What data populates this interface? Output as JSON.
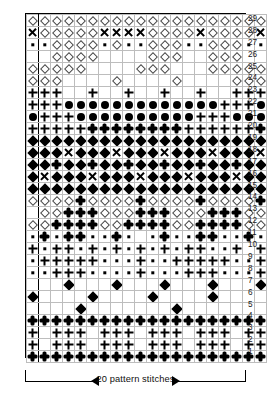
{
  "chart_data": {
    "type": "table",
    "title": "20 pattern stitches",
    "xlabel": "pattern stitches",
    "ylabel": "row",
    "columns": 20,
    "rows": 29,
    "grid": true,
    "legend_position": "none",
    "repeat_marker_after_column": 1,
    "row_labels": [
      "29",
      "28",
      "27",
      "26",
      "25",
      "24",
      "23",
      "22",
      "21",
      "20",
      "19",
      "18",
      "17",
      "16",
      "15",
      "14",
      "13",
      "12",
      "11",
      "10",
      "9",
      "8",
      "7",
      "6",
      "5",
      "4",
      "3",
      "2",
      "1"
    ],
    "symbol_key": {
      "d": "diamond-open",
      "D": "diamond-filled",
      "o": "circle-filled",
      "s": "square-small",
      "+": "plus",
      "x": "xmark",
      "c": "club",
      ".": "empty"
    },
    "cells": [
      {
        "row": "29",
        "symbols": [
          "d",
          "d",
          "d",
          "d",
          "d",
          "d",
          "d",
          "d",
          "d",
          "d",
          "d",
          "d",
          "d",
          "d",
          "d",
          "d",
          "d",
          "d",
          "d",
          "d"
        ]
      },
      {
        "row": "28",
        "symbols": [
          "x",
          "d",
          "d",
          "d",
          "d",
          "d",
          "x",
          "x",
          "x",
          "x",
          "d",
          "d",
          "d",
          "d",
          "x",
          "d",
          "d",
          "d",
          "d",
          "x"
        ]
      },
      {
        "row": "27",
        "symbols": [
          "s",
          "s",
          "d",
          "d",
          "d",
          "d",
          "s",
          "d",
          "s",
          "s",
          "d",
          "d",
          "d",
          "s",
          "s",
          "d",
          "d",
          "d",
          "s",
          "s"
        ]
      },
      {
        "row": "26",
        "symbols": [
          ".",
          ".",
          "d",
          "d",
          "d",
          "d",
          ".",
          ".",
          ".",
          ".",
          "d",
          "d",
          "d",
          ".",
          ".",
          "d",
          "d",
          "d",
          ".",
          "."
        ]
      },
      {
        "row": "25",
        "symbols": [
          "d",
          "d",
          "d",
          "d",
          "d",
          ".",
          ".",
          ".",
          ".",
          "d",
          "d",
          "d",
          ".",
          ".",
          ".",
          "d",
          "d",
          "d",
          "d",
          "d"
        ]
      },
      {
        "row": "24",
        "symbols": [
          "d",
          "d",
          "d",
          ".",
          ".",
          ".",
          ".",
          "d",
          ".",
          ".",
          ".",
          ".",
          "d",
          ".",
          ".",
          ".",
          ".",
          "d",
          "d",
          "d"
        ]
      },
      {
        "row": "23",
        "symbols": [
          "+",
          "+",
          "+",
          ".",
          ".",
          "+",
          ".",
          ".",
          "+",
          ".",
          ".",
          "+",
          ".",
          ".",
          "+",
          ".",
          ".",
          "+",
          "+",
          "+"
        ]
      },
      {
        "row": "22",
        "symbols": [
          "+",
          "+",
          "+",
          "o",
          "o",
          "o",
          "o",
          "o",
          "o",
          "o",
          "o",
          "o",
          "o",
          "o",
          "o",
          "o",
          "+",
          "+",
          "+",
          "o"
        ]
      },
      {
        "row": "21",
        "symbols": [
          "o",
          "+",
          "+",
          "+",
          "o",
          "o",
          "o",
          "o",
          "o",
          "o",
          "o",
          "o",
          "o",
          "o",
          "+",
          "+",
          "+",
          "o",
          "o",
          "o"
        ]
      },
      {
        "row": "20",
        "symbols": [
          "+",
          "+",
          "+",
          "+",
          "+",
          "c",
          "c",
          "c",
          "c",
          "c",
          "c",
          "c",
          "c",
          "+",
          "+",
          "+",
          "+",
          "+",
          "+",
          "c"
        ]
      },
      {
        "row": "19",
        "symbols": [
          "D",
          "D",
          "D",
          "D",
          "D",
          "D",
          "D",
          "D",
          "D",
          "D",
          "D",
          "D",
          "D",
          "D",
          "D",
          "D",
          "D",
          "D",
          "D",
          "D"
        ]
      },
      {
        "row": "18",
        "symbols": [
          "D",
          "D",
          "D",
          "x",
          "D",
          "D",
          "D",
          "x",
          "D",
          "D",
          "D",
          "x",
          "D",
          "D",
          "D",
          "x",
          "D",
          "D",
          "D",
          "x"
        ]
      },
      {
        "row": "17",
        "symbols": [
          "D",
          "D",
          "c",
          "D",
          "D",
          "c",
          "D",
          "D",
          "c",
          "D",
          "D",
          "c",
          "D",
          "D",
          "c",
          "D",
          "D",
          "c",
          "D",
          "D"
        ]
      },
      {
        "row": "16",
        "symbols": [
          "D",
          "x",
          "D",
          "D",
          "D",
          "x",
          "D",
          "D",
          "D",
          "x",
          "D",
          "D",
          "D",
          "x",
          "D",
          "D",
          "D",
          "x",
          "D",
          "D"
        ]
      },
      {
        "row": "15",
        "symbols": [
          "D",
          "D",
          "D",
          "D",
          "D",
          "D",
          "D",
          "D",
          "D",
          "D",
          "D",
          "D",
          "D",
          "D",
          "D",
          "D",
          "D",
          "D",
          "D",
          "D"
        ]
      },
      {
        "row": "14",
        "symbols": [
          "d",
          "d",
          "d",
          "d",
          "c",
          "d",
          "d",
          "d",
          "d",
          "c",
          "d",
          "d",
          "d",
          "d",
          "c",
          "d",
          "d",
          "d",
          "d",
          "c"
        ]
      },
      {
        "row": "13",
        "symbols": [
          ".",
          "d",
          "d",
          "c",
          "c",
          "c",
          "d",
          "d",
          "d",
          "c",
          "c",
          "c",
          "d",
          "d",
          "d",
          "c",
          "c",
          "c",
          "d",
          "d"
        ]
      },
      {
        "row": "12",
        "symbols": [
          "d",
          "d",
          "c",
          "c",
          "c",
          "c",
          "d",
          "d",
          "c",
          "c",
          "c",
          "c",
          "d",
          "d",
          "c",
          "c",
          "c",
          "c",
          "d",
          "d"
        ]
      },
      {
        "row": "11",
        "symbols": [
          "s",
          "c",
          "s",
          "c",
          "c",
          "s",
          "s",
          "c",
          "s",
          ".",
          "s",
          "c",
          "s",
          "s",
          "c",
          "c",
          "s",
          "s",
          "c",
          "s"
        ]
      },
      {
        "row": "10",
        "symbols": [
          "+",
          "s",
          "+",
          "+",
          "s",
          "+",
          "s",
          "+",
          "s",
          "+",
          "s",
          "+",
          "s",
          "+",
          "+",
          "s",
          "s",
          "+",
          ".",
          "+"
        ]
      },
      {
        "row": "9",
        "symbols": [
          "s",
          "+",
          "+",
          "+",
          "+",
          "+",
          "s",
          "s",
          "s",
          "+",
          "s",
          "s",
          "+",
          "+",
          "+",
          "+",
          "+",
          "s",
          "s",
          "+"
        ]
      },
      {
        "row": "8",
        "symbols": [
          "s",
          "s",
          "+",
          "+",
          "+",
          "s",
          "s",
          "s",
          "s",
          "+",
          "s",
          "s",
          "s",
          "+",
          "+",
          "+",
          "s",
          "s",
          "s",
          "+"
        ]
      },
      {
        "row": "7",
        "symbols": [
          ".",
          ".",
          ".",
          "D",
          ".",
          ".",
          ".",
          "D",
          ".",
          ".",
          ".",
          "D",
          ".",
          ".",
          ".",
          "D",
          ".",
          ".",
          ".",
          "D"
        ]
      },
      {
        "row": "6",
        "symbols": [
          "D",
          ".",
          ".",
          ".",
          ".",
          "D",
          ".",
          ".",
          ".",
          ".",
          "D",
          ".",
          ".",
          ".",
          ".",
          "D",
          ".",
          ".",
          ".",
          "."
        ]
      },
      {
        "row": "5",
        "symbols": [
          ".",
          ".",
          ".",
          ".",
          "D",
          ".",
          ".",
          ".",
          ".",
          ".",
          ".",
          ".",
          "D",
          ".",
          ".",
          ".",
          ".",
          ".",
          ".",
          "."
        ]
      },
      {
        "row": "4",
        "symbols": [
          "c",
          "c",
          "c",
          "c",
          "c",
          "c",
          "c",
          "c",
          "c",
          "c",
          "c",
          "c",
          "c",
          "c",
          "c",
          "c",
          "c",
          "c",
          "c",
          "c"
        ]
      },
      {
        "row": "3",
        "symbols": [
          "+",
          ".",
          "+",
          "+",
          "+",
          ".",
          "+",
          "+",
          "+",
          ".",
          "+",
          "+",
          "+",
          ".",
          "+",
          "+",
          "+",
          ".",
          "+",
          "+"
        ]
      },
      {
        "row": "2",
        "symbols": [
          "+",
          ".",
          "+",
          "+",
          "+",
          ".",
          "+",
          "+",
          "+",
          ".",
          "+",
          "+",
          "+",
          ".",
          "+",
          "+",
          "+",
          ".",
          "+",
          "+"
        ]
      },
      {
        "row": "1",
        "symbols": [
          "c",
          "c",
          "c",
          "c",
          "c",
          "c",
          "c",
          "c",
          "c",
          "c",
          "c",
          "c",
          "c",
          "c",
          "c",
          "c",
          "c",
          "c",
          "c",
          "c"
        ]
      }
    ]
  },
  "caption": {
    "text": "20 pattern stitches",
    "left_arrow": "left-arrow",
    "right_arrow": "right-arrow"
  },
  "colors": {
    "ink": "#000000",
    "grid_line": "#bdbdbd",
    "border": "#000000",
    "background": "#ffffff",
    "outline_symbol": "#4a4a4a"
  }
}
